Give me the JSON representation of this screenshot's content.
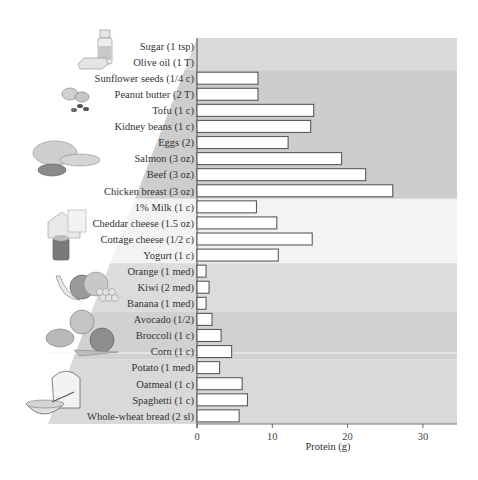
{
  "chart_data": {
    "type": "bar",
    "orientation": "horizontal",
    "title": "",
    "xlabel": "Protein (g)",
    "ylabel": "",
    "xlim": [
      0,
      34.5
    ],
    "xticks": [
      0,
      10,
      20,
      30
    ],
    "grid": false,
    "legend": null,
    "categories": [
      "Sugar (1 tsp)",
      "Olive oil (1 T)",
      "Sunflower seeds (1/4 c)",
      "Peanut butter (2 T)",
      "Tofu (1 c)",
      "Kidney beans (1 c)",
      "Eggs (2)",
      "Salmon (3 oz)",
      "Beef (3 oz)",
      "Chicken breast (3 oz)",
      "1% Milk (1 c)",
      "Cheddar cheese (1.5 oz)",
      "Cottage cheese (1/2 c)",
      "Yogurt (1 c)",
      "Orange (1 med)",
      "Kiwi (2 med)",
      "Banana (1 med)",
      "Avocado (1/2)",
      "Broccoli (1 c)",
      "Corn (1 c)",
      "Potato (1 med)",
      "Oatmeal (1 c)",
      "Spaghetti (1 c)",
      "Whole-wheat bread (2 sl)"
    ],
    "values": [
      0,
      0,
      8.1,
      8.1,
      15.5,
      15.1,
      12.1,
      19.2,
      22.4,
      26,
      7.9,
      10.6,
      15.3,
      10.8,
      1.2,
      1.6,
      1.2,
      2,
      3.2,
      4.6,
      3,
      6,
      6.7,
      5.6
    ],
    "groups": [
      {
        "name": "Fats & sugars",
        "rows": [
          0,
          1
        ],
        "color": "#d9d9d9",
        "icon": "oil-bottle-butter-icon"
      },
      {
        "name": "Meat, beans, nuts",
        "rows": [
          2,
          9
        ],
        "color": "#cdcdcd",
        "icon": "meat-fish-poultry-icon"
      },
      {
        "name": "Dairy",
        "rows": [
          10,
          13
        ],
        "color": "#f3f3f3",
        "icon": "dairy-cheese-milk-icon"
      },
      {
        "name": "Fruits",
        "rows": [
          14,
          16
        ],
        "color": "#dcdcdc",
        "icon": "fruit-icon"
      },
      {
        "name": "Vegetables",
        "rows": [
          17,
          19
        ],
        "color": "#d1d1d1",
        "icon": "vegetables-icon"
      },
      {
        "name": "Grains",
        "rows": [
          20,
          23
        ],
        "color": "#d9d9d9",
        "icon": "bread-cereal-icon"
      }
    ]
  },
  "axis": {
    "tick_labels": [
      "0",
      "10",
      "20",
      "30"
    ],
    "title": "Protein (g)"
  }
}
